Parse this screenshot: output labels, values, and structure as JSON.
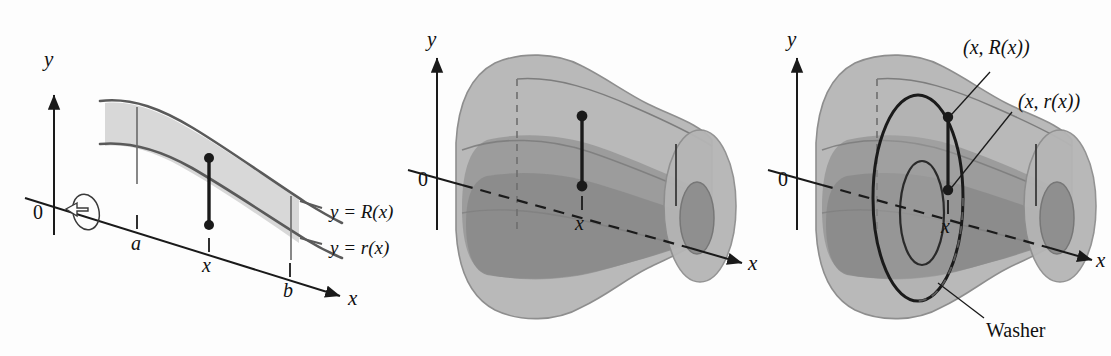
{
  "figure": {
    "background_color": "#fdfdfd",
    "ink_color": "#1a1a1a",
    "region_fill": "#d8d8d8",
    "solid_outer_fill": "#b9b9b9",
    "solid_inner_fill": "#9a9a9a",
    "solid_dark_fill": "#8a8a8a",
    "curve_color": "#555555"
  },
  "panel1": {
    "name": "plane-region",
    "y_axis_label": "y",
    "x_axis_label": "x",
    "origin_label": "0",
    "tick_a": "a",
    "tick_x": "x",
    "tick_b": "b",
    "curve_upper_label": "y = R(x)",
    "curve_lower_label": "y = r(x)",
    "rotation_icon": "revolve-arrow-icon"
  },
  "panel2": {
    "name": "solid-of-revolution",
    "y_axis_label": "y",
    "x_axis_label": "x",
    "origin_label": "0",
    "tick_x": "x"
  },
  "panel3": {
    "name": "washer-cross-section",
    "y_axis_label": "y",
    "x_axis_label": "x",
    "origin_label": "0",
    "tick_x": "x",
    "label_outer_point": "(x, R(x))",
    "label_inner_point": "(x, r(x))",
    "label_washer": "Washer"
  }
}
